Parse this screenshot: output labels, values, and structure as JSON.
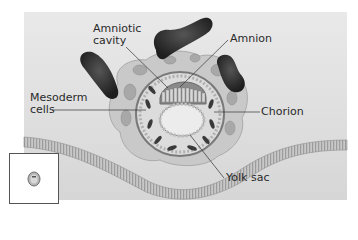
{
  "diagram": {
    "labels": {
      "amniotic_cavity_line1": "Amniotic",
      "amniotic_cavity_line2": "cavity",
      "amnion": "Amnion",
      "mesoderm_line1": "Mesoderm",
      "mesoderm_line2": "cells",
      "chorion": "Chorion",
      "yolk_sac": "Yolk sac"
    },
    "inset": {
      "description": "orientation thumbnail of embryo"
    },
    "colors": {
      "background": "#ffffff",
      "panel": "#e2e2e2",
      "tissue_dark": "#2e2e2e",
      "tissue_mid": "#9a9a9a",
      "tissue_light": "#cfcfcf",
      "leader_line": "#333333"
    }
  }
}
